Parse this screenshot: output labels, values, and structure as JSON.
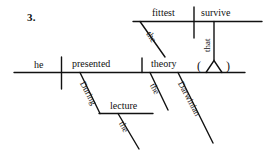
{
  "exercise": {
    "number": "3."
  },
  "diagram": {
    "type": "reed-kellogg-sentence-diagram",
    "sentence": "During the lecture he presented the Darwinian theory that the fittest survive.",
    "ink_color": "#111111",
    "background_color": "#ffffff",
    "main_clause": {
      "subject": "he",
      "verb": "presented",
      "direct_object": "theory"
    },
    "subordinate_clause": {
      "subject": "fittest",
      "verb": "survive",
      "connector": "that",
      "subject_modifier": "the"
    },
    "modifiers": {
      "prepositional_phrase": {
        "preposition": "During",
        "object": "lecture",
        "object_modifier": "the"
      },
      "object_modifiers": [
        "the",
        "Darwinian"
      ]
    },
    "placeholder_symbol": "( ^ )"
  },
  "labels": {
    "he": "he",
    "presented": "presented",
    "theory": "theory",
    "fittest": "fittest",
    "survive": "survive",
    "that": "that",
    "during": "During",
    "lecture": "lecture",
    "the_fittest": "the",
    "the_lecture": "the",
    "the_theory": "the",
    "darwinian": "Darwinian",
    "paren_open": "(",
    "paren_close": ")"
  }
}
